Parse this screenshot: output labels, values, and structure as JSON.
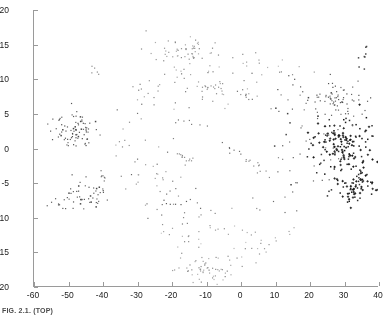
{
  "chart_data": {
    "type": "scatter",
    "title": "",
    "subtitle": "",
    "xlabel": "",
    "ylabel": "",
    "xlim": [
      -60,
      40
    ],
    "ylim": [
      -20,
      20
    ],
    "xticks": [
      -60,
      -50,
      -40,
      -30,
      -20,
      -10,
      0,
      10,
      20,
      30,
      40
    ],
    "yticks": [
      -20,
      -15,
      -10,
      -5,
      0,
      5,
      10,
      15,
      20
    ],
    "xticklabels": [
      "-60",
      "-50",
      "-40",
      "-30",
      "-20",
      "-10",
      "0",
      "10",
      "20",
      "30",
      "40"
    ],
    "yticklabels": [
      "-20",
      "-15",
      "-10",
      "-5",
      "0",
      "5",
      "10",
      "15",
      "20"
    ],
    "grid": false,
    "legend": null,
    "marker": "dot",
    "marker_size": 1.6,
    "n_points": 780,
    "annotations": [],
    "series": [
      {
        "name": "cloud",
        "color": "#333333",
        "ring": {
          "center_x": -4.0,
          "center_y": -0.5,
          "radius_x": 31.0,
          "radius_y": 15.5,
          "radial_spread": 0.3,
          "hollow_radius": 0.42
        },
        "density_lobes": [
          {
            "cx": 30.0,
            "cy": 0.5,
            "rx": 10.0,
            "ry": 4.5,
            "n": 150,
            "shade": "dark"
          },
          {
            "cx": 33.0,
            "cy": -5.5,
            "rx": 8.0,
            "ry": 2.6,
            "n": 70,
            "shade": "dark"
          },
          {
            "cx": 27.0,
            "cy": 7.0,
            "rx": 9.0,
            "ry": 3.2,
            "n": 70,
            "shade": "mid"
          },
          {
            "cx": -48.0,
            "cy": 2.5,
            "rx": 7.5,
            "ry": 3.0,
            "n": 80,
            "shade": "mid"
          },
          {
            "cx": -45.0,
            "cy": -6.5,
            "rx": 8.0,
            "ry": 2.2,
            "n": 45,
            "shade": "mid"
          },
          {
            "cx": -14.0,
            "cy": 14.0,
            "rx": 11.0,
            "ry": 2.4,
            "n": 60,
            "shade": "light"
          },
          {
            "cx": -10.0,
            "cy": -17.5,
            "rx": 10.0,
            "ry": 2.0,
            "n": 55,
            "shade": "light"
          }
        ]
      }
    ]
  },
  "caption": {
    "text": "FIG. 2.1. (TOP)"
  },
  "axes": {
    "line_color": "#9a9a9a",
    "tick_len_px": 4,
    "label_color": "#1a1a1a",
    "label_size_px": 8.5
  }
}
